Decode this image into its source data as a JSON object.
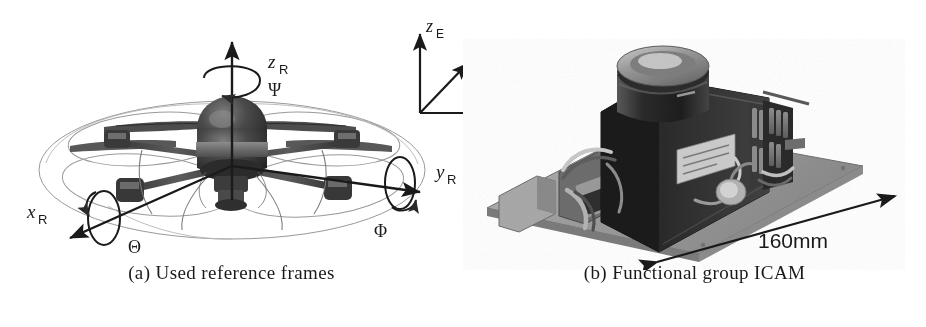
{
  "figure": {
    "background_color": "#ffffff",
    "ink_color": "#1a1a1a",
    "panels": [
      {
        "id": "a",
        "caption": "(a) Used reference frames",
        "subject": "multirotor-uav-reference-frames-diagram",
        "body_frame": {
          "name": "R",
          "axes": [
            {
              "label": "x_R",
              "display": "x",
              "subscript": "R",
              "direction": "down-left"
            },
            {
              "label": "y_R",
              "display": "y",
              "subscript": "R",
              "direction": "right"
            },
            {
              "label": "z_R",
              "display": "z",
              "subscript": "R",
              "direction": "up"
            }
          ],
          "rotations": [
            {
              "label": "Theta",
              "symbol": "Θ",
              "about_axis": "x_R"
            },
            {
              "label": "Phi",
              "symbol": "Φ",
              "about_axis": "y_R"
            },
            {
              "label": "Psi",
              "symbol": "Ψ",
              "about_axis": "z_R"
            }
          ]
        },
        "earth_frame": {
          "name": "E",
          "axes": [
            {
              "label": "x_E",
              "display": "x",
              "subscript": "E",
              "direction": "right"
            },
            {
              "label": "y_E",
              "display": "y",
              "subscript": "E",
              "direction": "up-right"
            },
            {
              "label": "z_E",
              "display": "z",
              "subscript": "E",
              "direction": "up"
            }
          ]
        },
        "rotor_count": 4
      },
      {
        "id": "b",
        "caption": "(b) Functional group ICAM",
        "subject": "icam-functional-group-hardware-photograph",
        "dimension_annotation": {
          "value": "160mm",
          "arrow": "double-headed",
          "edge": "baseplate-front-edge"
        }
      }
    ]
  }
}
